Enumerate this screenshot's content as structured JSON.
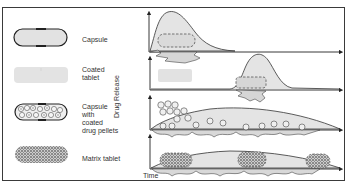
{
  "diagram": {
    "type": "drug release profiles by dosage form",
    "dosage_forms": [
      {
        "name": "Capsule",
        "label": "Capsule",
        "release_profile": "immediate release, early sharp peak"
      },
      {
        "name": "Coated tablet",
        "label_line1": "Coated",
        "label_line2": "tablet",
        "release_profile": "delayed release, late peak"
      },
      {
        "name": "Capsule with coated drug pellets",
        "label_line1": "Capsule",
        "label_line2": "with",
        "label_line3": "coated",
        "label_line4": "drug pellets",
        "release_profile": "sustained release, gradual decline"
      },
      {
        "name": "Matrix tablet",
        "label": "Matrix tablet",
        "release_profile": "sustained release, plateau"
      }
    ],
    "axes": {
      "ylabel": "Drug Release",
      "xlabel": "Time"
    },
    "colors": {
      "outline": "#3a3a3a",
      "fill": "#e4e4e4",
      "coated_fill": "#e0e0e0",
      "background": "#ffffff"
    }
  }
}
